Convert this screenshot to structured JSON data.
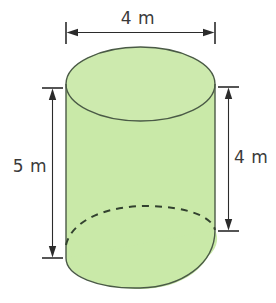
{
  "figure": {
    "type": "solid-geometry-diagram",
    "shape": "cylinder",
    "title_text": "",
    "colors": {
      "background": "#ffffff",
      "solid_fill": "#c9e9a8",
      "solid_outline": "#4a5a46",
      "hidden_edge": "#32412f",
      "dimension_line": "#2b2b2b",
      "label_text": "#3a3a3a"
    },
    "dimensions": [
      {
        "name": "diameter",
        "label": "4 m",
        "value": 4,
        "unit": "m",
        "orientation": "horizontal",
        "position": "top",
        "measures": "cylinder diameter across the top face"
      },
      {
        "name": "slant-overall-height",
        "label": "5 m",
        "value": 5,
        "unit": "m",
        "orientation": "vertical",
        "position": "left",
        "measures": "longest side height of the cylinder"
      },
      {
        "name": "height",
        "label": "4 m",
        "value": 4,
        "unit": "m",
        "orientation": "vertical",
        "position": "right",
        "measures": "shortest side height of the cylinder"
      }
    ]
  },
  "labels": {
    "top": "4 m",
    "left": "5 m",
    "right": "4 m"
  },
  "geometry": {
    "top_ellipse": {
      "cx": 140.5,
      "cy": 84,
      "rx": 74.5,
      "ry": 37
    },
    "left_wall_x": 66,
    "right_wall_x": 215,
    "left_wall_bottom_y": 258,
    "right_wall_bottom_y": 230,
    "bottom_curve_lowest_y": 288,
    "hidden_arc_peak_y": 206,
    "top_dim_line_y": 32,
    "left_dim_line_x": 52,
    "left_dim_top_y": 88,
    "left_dim_bottom_y": 258,
    "right_dim_line_x": 228,
    "right_dim_top_y": 87,
    "right_dim_bottom_y": 231
  }
}
